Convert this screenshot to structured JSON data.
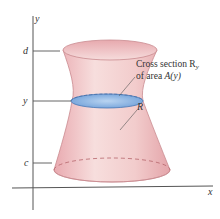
{
  "figure": {
    "axes": {
      "x_label": "x",
      "y_label": "y"
    },
    "ticks": [
      {
        "label": "d",
        "y": 51
      },
      {
        "label": "y",
        "y": 101
      },
      {
        "label": "c",
        "y": 163
      }
    ],
    "annotations": {
      "cross_section_line1": "Cross section R",
      "cross_section_sub": "y",
      "cross_section_line2_prefix": "of area ",
      "cross_section_line2_func": "A(y)",
      "region_label": "R"
    },
    "colors": {
      "solid_fill": "#f2c9c9",
      "solid_edge": "#c98a8f",
      "cross_section_fill": "#8fb8e6",
      "axis": "#555555"
    }
  }
}
